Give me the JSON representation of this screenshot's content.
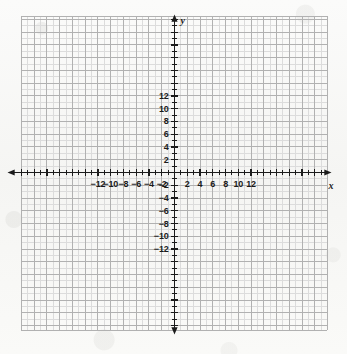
{
  "chart_data": {
    "type": "scatter",
    "title": "",
    "subtitle": "",
    "xlabel": "x",
    "ylabel": "y",
    "xlim": [
      -13.5,
      13.5
    ],
    "ylim": [
      -14,
      14
    ],
    "grid": true,
    "grid_minor_step": 1,
    "grid_major_step": 2,
    "legend": "none",
    "series": [],
    "x_tick_labels": [
      "-12",
      "-10",
      "-8",
      "-6",
      "-4",
      "-2",
      "2",
      "4",
      "6",
      "8",
      "10",
      "12"
    ],
    "x_tick_values": [
      -12,
      -10,
      -8,
      -6,
      -4,
      -2,
      2,
      4,
      6,
      8,
      10,
      12
    ],
    "y_tick_labels": [
      "12",
      "10",
      "8",
      "6",
      "4",
      "2",
      "-2",
      "-4",
      "-6",
      "-8",
      "-10",
      "-12"
    ],
    "y_tick_values": [
      12,
      10,
      8,
      6,
      4,
      2,
      -2,
      -4,
      -6,
      -8,
      -10,
      -12
    ],
    "minor_tick_step": 1,
    "origin_label": "",
    "annotations": []
  },
  "figure": {
    "name": "coordinate-plane",
    "x_axis_letter": "x",
    "y_axis_letter": "y",
    "axis_color": "#1b1b1b",
    "minor_grid_color": "#dcdcdc",
    "major_grid_color": "#b1b1b1",
    "background_color": "#f7f7f5"
  },
  "geometry": {
    "width": 347,
    "height": 354,
    "grid_left": 21,
    "grid_top": 16,
    "grid_right": 327,
    "grid_bottom": 330,
    "origin_x": 174.5,
    "origin_y": 172.5,
    "unit_px": 6.38
  }
}
